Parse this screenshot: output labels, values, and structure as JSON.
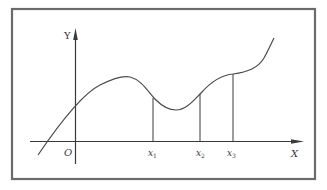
{
  "diagram": {
    "type": "function-graph",
    "frame": {
      "stroke": "#6b6b6b"
    },
    "axes": {
      "x_label": "X",
      "y_label": "Y",
      "origin_label": "O"
    },
    "marked_points": [
      {
        "label": "x",
        "sub": "1"
      },
      {
        "label": "x",
        "sub": "2"
      },
      {
        "label": "x",
        "sub": "3"
      }
    ],
    "curve": {
      "description": "Smooth curve rising from lower left, crossing x-axis left of O, local maximum between O and x1, local minimum between x1 and x2, inflection near x3, then rising steeply",
      "color": "#4a4a4a"
    }
  }
}
